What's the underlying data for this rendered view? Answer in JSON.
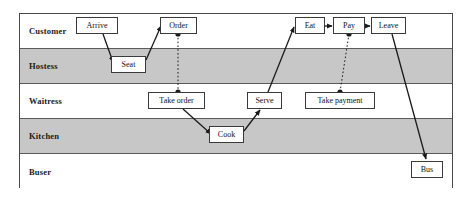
{
  "diagram": {
    "type": "swimlane-activity-diagram",
    "frame": {
      "x": 19,
      "y": 13,
      "width": 434,
      "height": 175
    },
    "colors": {
      "lane_shaded": "#c7c7c7",
      "lane_white": "#ffffff",
      "border": "#4a4a4a",
      "text": "#111111",
      "connector": "#1a1a1a"
    },
    "lanes": [
      {
        "id": "customer",
        "label": "Customer",
        "shaded": false,
        "y": 0
      },
      {
        "id": "hostess",
        "label": "Hostess",
        "shaded": true,
        "y": 35
      },
      {
        "id": "waitress",
        "label": "Waitress",
        "shaded": false,
        "y": 70
      },
      {
        "id": "kitchen",
        "label": "Kitchen",
        "shaded": true,
        "y": 105
      },
      {
        "id": "buser",
        "label": "Buser",
        "shaded": false,
        "y": 140
      }
    ],
    "tasks": [
      {
        "id": "arrive",
        "label": "Arrive",
        "lane": "customer",
        "x": 76,
        "y": 17,
        "width": 42
      },
      {
        "id": "order",
        "label": "Order",
        "lane": "customer",
        "x": 160,
        "y": 17,
        "width": 37
      },
      {
        "id": "eat",
        "label": "Eat",
        "lane": "customer",
        "x": 295,
        "y": 17,
        "width": 30
      },
      {
        "id": "pay",
        "label": "Pay",
        "lane": "customer",
        "x": 333,
        "y": 17,
        "width": 32
      },
      {
        "id": "leave",
        "label": "Leave",
        "lane": "customer",
        "x": 371,
        "y": 17,
        "width": 35
      },
      {
        "id": "seat",
        "label": "Seat",
        "lane": "hostess",
        "x": 111,
        "y": 56,
        "width": 35
      },
      {
        "id": "take-order",
        "label": "Take order",
        "lane": "waitress",
        "x": 148,
        "y": 92,
        "width": 57
      },
      {
        "id": "serve",
        "label": "Serve",
        "lane": "waitress",
        "x": 247,
        "y": 92,
        "width": 35
      },
      {
        "id": "take-payment",
        "label": "Take payment",
        "lane": "waitress",
        "x": 305,
        "y": 92,
        "width": 70
      },
      {
        "id": "cook",
        "label": "Cook",
        "lane": "kitchen",
        "x": 209,
        "y": 126,
        "width": 35
      },
      {
        "id": "bus",
        "label": "Bus",
        "lane": "buser",
        "x": 411,
        "y": 161,
        "width": 32
      }
    ],
    "connectors": [
      {
        "id": "arrive-to-seat",
        "from": "arrive",
        "to": "seat",
        "style": "solid",
        "arrow": true,
        "x1": 103,
        "y1": 34,
        "x2": 113,
        "y2": 62
      },
      {
        "id": "seat-to-order",
        "from": "seat",
        "to": "order",
        "style": "solid",
        "arrow": true,
        "x1": 146,
        "y1": 60,
        "x2": 161,
        "y2": 26
      },
      {
        "id": "order-to-take-order",
        "from": "order",
        "to": "take-order",
        "style": "dotted",
        "arrow": false,
        "x1": 178,
        "y1": 34,
        "x2": 178,
        "y2": 92
      },
      {
        "id": "take-order-to-cook",
        "from": "take-order",
        "to": "cook",
        "style": "solid",
        "arrow": true,
        "x1": 183,
        "y1": 109,
        "x2": 211,
        "y2": 134
      },
      {
        "id": "cook-to-serve",
        "from": "cook",
        "to": "serve",
        "style": "solid",
        "arrow": true,
        "x1": 244,
        "y1": 131,
        "x2": 260,
        "y2": 110
      },
      {
        "id": "serve-to-eat",
        "from": "serve",
        "to": "eat",
        "style": "solid",
        "arrow": true,
        "x1": 268,
        "y1": 92,
        "x2": 294,
        "y2": 27
      },
      {
        "id": "eat-to-pay",
        "from": "eat",
        "to": "pay",
        "style": "solid",
        "arrow": true,
        "x1": 325,
        "y1": 26,
        "x2": 332,
        "y2": 26
      },
      {
        "id": "pay-to-take-payment",
        "from": "pay",
        "to": "take-payment",
        "style": "dotted",
        "arrow": false,
        "x1": 349,
        "y1": 34,
        "x2": 340,
        "y2": 92
      },
      {
        "id": "pay-to-leave",
        "from": "pay",
        "to": "leave",
        "style": "solid",
        "arrow": true,
        "x1": 365,
        "y1": 26,
        "x2": 370,
        "y2": 26
      },
      {
        "id": "leave-to-bus",
        "from": "leave",
        "to": "bus",
        "style": "solid",
        "arrow": true,
        "x1": 392,
        "y1": 34,
        "x2": 426,
        "y2": 159
      }
    ],
    "junction_dots": [
      {
        "id": "order-dot",
        "on": "order",
        "x": 178,
        "y": 34
      },
      {
        "id": "take-order-dot",
        "on": "take-order",
        "x": 178,
        "y": 92
      },
      {
        "id": "pay-dot",
        "on": "pay",
        "x": 349,
        "y": 34
      },
      {
        "id": "take-payment-dot",
        "on": "take-payment",
        "x": 340,
        "y": 92
      }
    ]
  }
}
